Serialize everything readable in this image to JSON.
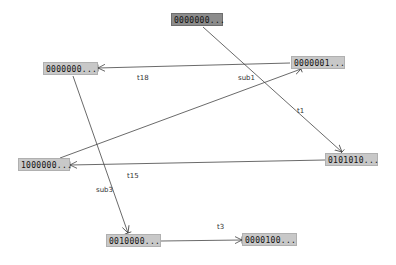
{
  "diagram": {
    "type": "state-graph",
    "nodes": [
      {
        "id": "n0",
        "label": "0000000...",
        "selected": true
      },
      {
        "id": "n1",
        "label": "0000000..."
      },
      {
        "id": "n2",
        "label": "0000001..."
      },
      {
        "id": "n3",
        "label": "1000000..."
      },
      {
        "id": "n4",
        "label": "0101010..."
      },
      {
        "id": "n5",
        "label": "0010000..."
      },
      {
        "id": "n6",
        "label": "0000100..."
      }
    ],
    "edges": [
      {
        "from": "n0",
        "to": "n4",
        "label": "t1"
      },
      {
        "from": "n2",
        "to": "n1",
        "label": "t18"
      },
      {
        "from": "n3",
        "to": "n2",
        "label": "sub1"
      },
      {
        "from": "n4",
        "to": "n3",
        "label": "t15"
      },
      {
        "from": "n1",
        "to": "n5",
        "label": "sub3"
      },
      {
        "from": "n5",
        "to": "n6",
        "label": "t3"
      }
    ]
  },
  "colors": {
    "node_fill": "#c8c8c8",
    "selected_node_fill": "#8c8c8c",
    "edge": "#444444",
    "background": "#ffffff"
  }
}
